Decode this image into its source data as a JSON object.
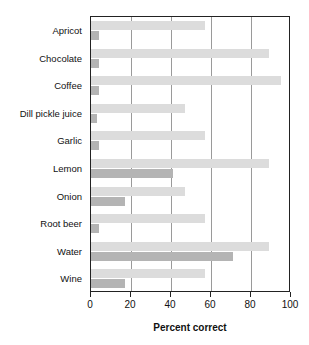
{
  "chart_data": {
    "type": "bar",
    "orientation": "horizontal",
    "title": "",
    "xlabel": "Percent correct",
    "ylabel": "",
    "xlim": [
      0,
      100
    ],
    "xticks": [
      0,
      20,
      40,
      60,
      80,
      100
    ],
    "xticklabels": [
      "0",
      "20",
      "40",
      "60",
      "80",
      "100"
    ],
    "grid": "vertical",
    "legend": "none",
    "categories": [
      "Apricot",
      "Chocolate",
      "Coffee",
      "Dill pickle juice",
      "Garlic",
      "Lemon",
      "Onion",
      "Root beer",
      "Water",
      "Wine"
    ],
    "series": [
      {
        "name": "light",
        "color": "#dcdcdc",
        "values": [
          57,
          89,
          95,
          47,
          57,
          89,
          47,
          57,
          89,
          57
        ]
      },
      {
        "name": "dark",
        "color": "#b4b4b4",
        "values": [
          4,
          4,
          4,
          3,
          4,
          41,
          17,
          4,
          71,
          17
        ]
      }
    ]
  },
  "axis": {
    "xtitle": "Percent correct"
  }
}
